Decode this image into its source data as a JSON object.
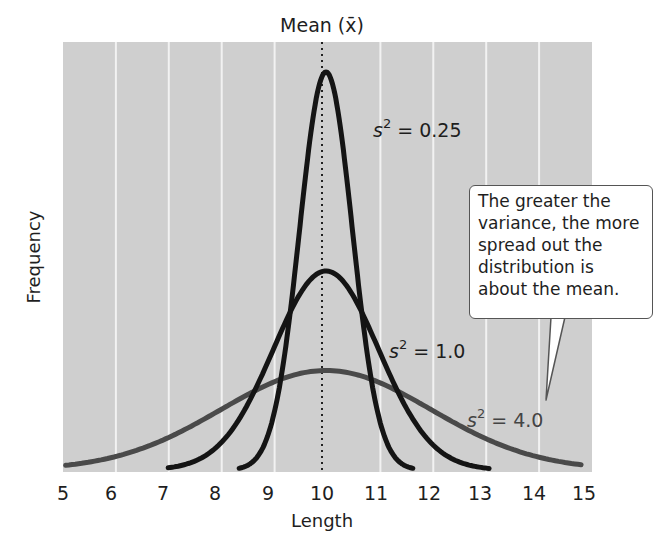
{
  "chart_data": {
    "type": "line",
    "title": "Mean (x̄)",
    "xlabel": "Length",
    "ylabel": "Frequency",
    "xlim": [
      5,
      15
    ],
    "x_ticks": [
      5,
      6,
      7,
      8,
      9,
      10,
      11,
      12,
      13,
      14,
      15
    ],
    "grid": {
      "vertical": true,
      "horizontal": false
    },
    "mean": 10,
    "series": [
      {
        "name": "s² = 0.25",
        "variance": 0.25,
        "mean": 10,
        "color": "#1a1a1a",
        "relative_peak": 1.0
      },
      {
        "name": "s² = 1.0",
        "variance": 1.0,
        "mean": 10,
        "color": "#111111",
        "relative_peak": 0.5
      },
      {
        "name": "s² = 4.0",
        "variance": 4.0,
        "mean": 10,
        "color": "#4a4a4a",
        "relative_peak": 0.25
      }
    ],
    "annotations": [
      "The greater the variance, the more spread out the distribution is about the mean."
    ]
  },
  "labels": {
    "mean_title": "Mean (x̄)",
    "x_axis": "Length",
    "y_axis": "Frequency",
    "ticks": [
      "5",
      "6",
      "7",
      "8",
      "9",
      "10",
      "11",
      "12",
      "13",
      "14",
      "15"
    ],
    "s_var_025": "s",
    "s_var_025_rest": " = 0.25",
    "s_var_1": "s",
    "s_var_1_rest": " = 1.0",
    "s_var_4": "s",
    "s_var_4_rest": " = 4.0",
    "sup": "2"
  },
  "callout": {
    "lines": [
      "The greater the",
      "variance, the more",
      "spread out the",
      "distribution is",
      "about the mean."
    ]
  },
  "colors": {
    "plot_bg": "#cfcfcf",
    "grid": "#f2f2f2",
    "curve_dark": "#141414",
    "curve_gray": "#4a4a4a"
  }
}
